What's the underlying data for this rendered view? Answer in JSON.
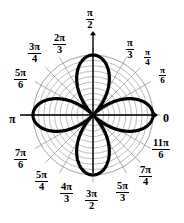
{
  "figure": {
    "width": 184,
    "height": 223,
    "background": "#ffffff",
    "ink_color": "#000000",
    "grid_color": "#9a9a9a",
    "curve_color": "#000000"
  },
  "axes": {
    "origin_x": 93,
    "origin_y": 115,
    "grid_radius": 60,
    "axis_arrow_labels": {
      "right": "0",
      "top_num": "π",
      "top_den": "2",
      "left": "π",
      "bottom_num": "3π",
      "bottom_den": "2"
    }
  },
  "angle_labels": [
    {
      "id": "theta-0",
      "text": "0",
      "num": "0",
      "den": "",
      "type": "plain",
      "deg": 0,
      "x": 163,
      "y": 109,
      "size": "lg"
    },
    {
      "id": "theta-pi-6",
      "text": "π/6",
      "num": "π",
      "den": "6",
      "type": "frac",
      "deg": 30,
      "x": 159,
      "y": 66,
      "size": "sm"
    },
    {
      "id": "theta-pi-4",
      "text": "π/4",
      "num": "π",
      "den": "4",
      "type": "frac",
      "deg": 45,
      "x": 144,
      "y": 48,
      "size": "sm"
    },
    {
      "id": "theta-pi-3",
      "text": "π/3",
      "num": "π",
      "den": "3",
      "type": "frac",
      "deg": 60,
      "x": 126,
      "y": 38,
      "size": "md"
    },
    {
      "id": "theta-pi-2",
      "text": "π/2",
      "num": "π",
      "den": "2",
      "type": "frac",
      "deg": 90,
      "x": 86,
      "y": 8,
      "size": "md"
    },
    {
      "id": "theta-2pi-3",
      "text": "2π/3",
      "num": "2π",
      "den": "3",
      "type": "frac",
      "deg": 120,
      "x": 53,
      "y": 33,
      "size": "md"
    },
    {
      "id": "theta-3pi-4",
      "text": "3π/4",
      "num": "3π",
      "den": "4",
      "type": "frac",
      "deg": 135,
      "x": 28,
      "y": 42,
      "size": "md"
    },
    {
      "id": "theta-5pi-6",
      "text": "5π/6",
      "num": "5π",
      "den": "6",
      "type": "frac",
      "deg": 150,
      "x": 14,
      "y": 68,
      "size": "md"
    },
    {
      "id": "theta-pi",
      "text": "π",
      "num": "π",
      "den": "",
      "type": "plain",
      "deg": 180,
      "x": 9,
      "y": 110,
      "size": "lg"
    },
    {
      "id": "theta-7pi-6",
      "text": "7π/6",
      "num": "7π",
      "den": "6",
      "type": "frac",
      "deg": 210,
      "x": 14,
      "y": 148,
      "size": "md"
    },
    {
      "id": "theta-5pi-4",
      "text": "5π/4",
      "num": "5π",
      "den": "4",
      "type": "frac",
      "deg": 225,
      "x": 35,
      "y": 170,
      "size": "md"
    },
    {
      "id": "theta-4pi-3",
      "text": "4π/3",
      "num": "4π",
      "den": "3",
      "type": "frac",
      "deg": 240,
      "x": 60,
      "y": 182,
      "size": "md"
    },
    {
      "id": "theta-3pi-2",
      "text": "3π/2",
      "num": "3π",
      "den": "2",
      "type": "frac",
      "deg": 270,
      "x": 85,
      "y": 189,
      "size": "md"
    },
    {
      "id": "theta-5pi-3",
      "text": "5π/3",
      "num": "5π",
      "den": "3",
      "type": "frac",
      "deg": 300,
      "x": 116,
      "y": 181,
      "size": "md"
    },
    {
      "id": "theta-7pi-4",
      "text": "7π/4",
      "num": "7π",
      "den": "4",
      "type": "frac",
      "deg": 315,
      "x": 139,
      "y": 165,
      "size": "md"
    },
    {
      "id": "theta-11pi-6",
      "text": "11π/6",
      "num": "11π",
      "den": "6",
      "type": "frac",
      "deg": 330,
      "x": 152,
      "y": 138,
      "size": "md"
    }
  ],
  "chart_data": {
    "type": "line",
    "coordinate_system": "polar",
    "equation": "r = a cos(2θ)",
    "petal_count": 4,
    "petal_axis_angles_deg": [
      0,
      90,
      180,
      270
    ],
    "max_radius": 1.0,
    "grid": true,
    "grid_circles": 11,
    "grid_circle_radii": [
      0.09,
      0.18,
      0.27,
      0.36,
      0.45,
      0.55,
      0.64,
      0.73,
      0.82,
      0.91,
      1.0
    ],
    "angular_spokes_deg": [
      0,
      30,
      45,
      60,
      90,
      120,
      135,
      150,
      180,
      210,
      225,
      240,
      270,
      300,
      315,
      330
    ],
    "theta_tick_labels": [
      "0",
      "π/6",
      "π/4",
      "π/3",
      "π/2",
      "2π/3",
      "3π/4",
      "5π/6",
      "π",
      "7π/6",
      "5π/4",
      "4π/3",
      "3π/2",
      "5π/3",
      "7π/4",
      "11π/6"
    ],
    "thetalim_deg": [
      0,
      360
    ],
    "rlim": [
      0,
      1.0
    ],
    "legend": null,
    "xlabel": "",
    "ylabel": "",
    "series": [
      {
        "name": "r = cos(2θ)",
        "stroke": "#000000",
        "stroke_width": 3.2,
        "samples_deg": [
          0,
          10,
          20,
          30,
          40,
          45,
          50,
          60,
          70,
          80,
          90,
          100,
          110,
          120,
          130,
          135,
          140,
          150,
          160,
          170,
          180,
          190,
          200,
          210,
          220,
          225,
          230,
          240,
          250,
          260,
          270,
          280,
          290,
          300,
          310,
          315,
          320,
          330,
          340,
          350,
          360
        ],
        "r_values": [
          1.0,
          0.94,
          0.766,
          0.5,
          0.174,
          0.0,
          0.174,
          0.5,
          0.766,
          0.94,
          1.0,
          0.94,
          0.766,
          0.5,
          0.174,
          0.0,
          0.174,
          0.5,
          0.766,
          0.94,
          1.0,
          0.94,
          0.766,
          0.5,
          0.174,
          0.0,
          0.174,
          0.5,
          0.766,
          0.94,
          1.0,
          0.94,
          0.766,
          0.5,
          0.174,
          0.0,
          0.174,
          0.5,
          0.766,
          0.94,
          1.0
        ]
      }
    ]
  }
}
